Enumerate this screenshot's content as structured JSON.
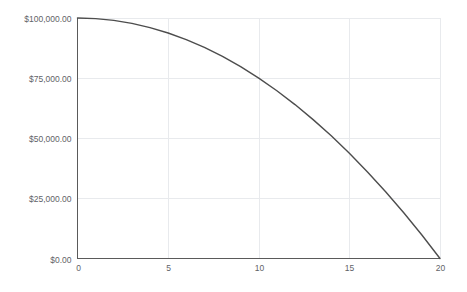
{
  "chart_data": {
    "type": "line",
    "title": "",
    "subtitle": "",
    "xlabel": "",
    "ylabel": "",
    "xlim": [
      0,
      20
    ],
    "ylim": [
      0,
      100000
    ],
    "grid": true,
    "legend": null,
    "legend_position": "none",
    "x_tick_labels": [
      "0",
      "5",
      "10",
      "15",
      "20"
    ],
    "x_tick_values": [
      0,
      5,
      10,
      15,
      20
    ],
    "y_tick_labels": [
      "$0.00",
      "$25,000.00",
      "$50,000.00",
      "$75,000.00",
      "$100,000.00"
    ],
    "y_tick_values": [
      0,
      25000,
      50000,
      75000,
      100000
    ],
    "series": [
      {
        "name": "value",
        "color": "#4d4d4d",
        "x": [
          0,
          1,
          2,
          3,
          4,
          5,
          6,
          7,
          8,
          9,
          10,
          11,
          12,
          13,
          14,
          15,
          16,
          17,
          18,
          19,
          20
        ],
        "values": [
          100000,
          99750,
          99000,
          97750,
          96000,
          93750,
          91000,
          87750,
          84000,
          79750,
          75000,
          69750,
          64000,
          57750,
          51000,
          43750,
          36000,
          27750,
          19000,
          9750,
          0
        ]
      }
    ]
  },
  "axes": {
    "y_axis_name": "currency-axis",
    "x_axis_name": "period-axis"
  }
}
